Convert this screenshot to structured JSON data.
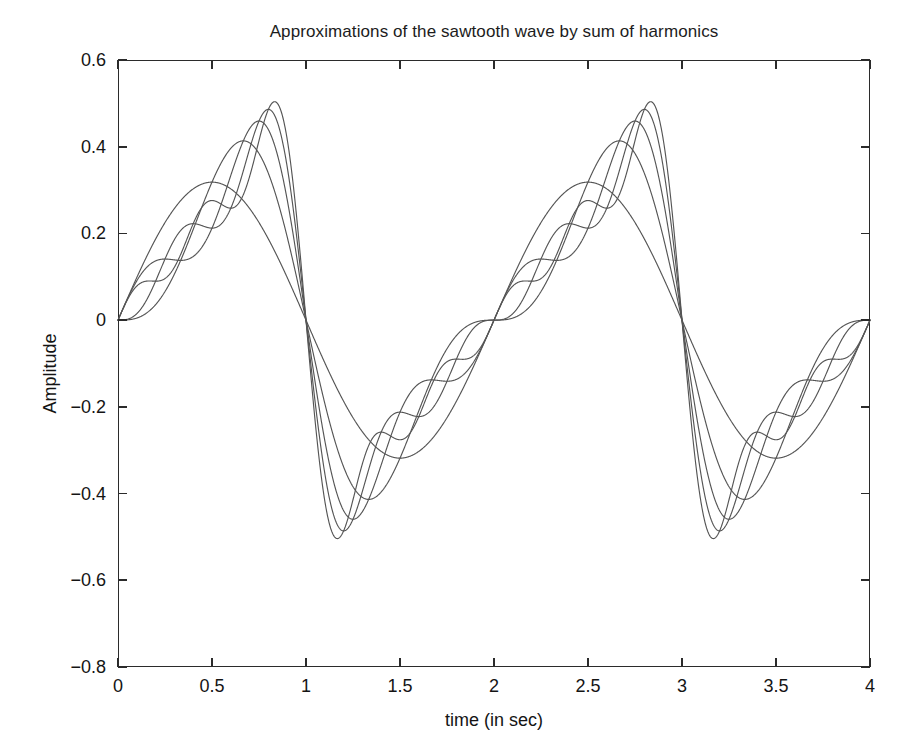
{
  "figure": {
    "background": "#ffffff",
    "line_color": "#555555",
    "axis_color": "#2b2b2b"
  },
  "chart_data": {
    "type": "line",
    "title": "Approximations of the sawtooth wave by sum of harmonics",
    "xlabel": "time (in sec)",
    "ylabel": "Amplitude",
    "xlim": [
      0,
      4
    ],
    "ylim": [
      -0.8,
      0.6
    ],
    "xticks": [
      0,
      0.5,
      1,
      1.5,
      2,
      2.5,
      3,
      3.5,
      4
    ],
    "xticklabels": [
      "0",
      "0.5",
      "1",
      "1.5",
      "2",
      "2.5",
      "3",
      "3.5",
      "4"
    ],
    "yticks": [
      -0.8,
      -0.6,
      -0.4,
      -0.2,
      0,
      0.2,
      0.4,
      0.6
    ],
    "yticklabels": [
      "-0.8",
      "-0.6",
      "-0.4",
      "-0.2",
      "0",
      "0.2",
      "0.4",
      "0.6"
    ],
    "grid": false,
    "legend": "none",
    "period_sec": 2,
    "fundamental_frequency_hz": 0.5,
    "amplitude_scale": 0.3183,
    "series": [
      {
        "name": "1 harmonic",
        "harmonics": 1,
        "peak": 0.318,
        "trough": -0.318,
        "peak_time": 1.5,
        "trough_time": 0.5
      },
      {
        "name": "2 harmonics",
        "harmonics": 2,
        "peak": 0.42,
        "trough": -0.42,
        "peak_time": 1.68,
        "trough_time": 0.32
      },
      {
        "name": "3 harmonics",
        "harmonics": 3,
        "peak": 0.468,
        "trough": -0.468,
        "peak_time": 1.76,
        "trough_time": 0.24
      },
      {
        "name": "4 harmonics",
        "harmonics": 4,
        "peak": 0.494,
        "trough": -0.494,
        "peak_time": 1.81,
        "trough_time": 0.19
      },
      {
        "name": "5 harmonics",
        "harmonics": 5,
        "peak": 0.512,
        "trough": -0.512,
        "peak_time": 1.85,
        "trough_time": 0.15
      }
    ],
    "annotations": [
      "All partial sums pass through zero at t = 0, 2, 4",
      "Gibbs overshoot near the discontinuities at t = 2 and t = 4"
    ]
  }
}
